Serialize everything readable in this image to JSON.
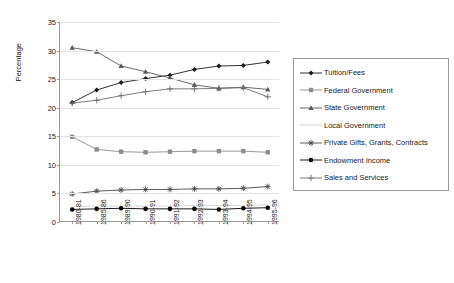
{
  "chart_data": {
    "type": "line",
    "title": "",
    "xlabel": "",
    "ylabel": "Percentage",
    "ylim": [
      0,
      35
    ],
    "yticks": [
      0,
      5,
      10,
      15,
      20,
      25,
      30,
      35
    ],
    "grid": true,
    "legend_position": "right",
    "categories": [
      "1980-81",
      "1985-86",
      "1989-90",
      "1990-91",
      "1991-92",
      "1992-93",
      "1993-94",
      "1994-95",
      "1995-96"
    ],
    "series": [
      {
        "name": "Tuition/Fees",
        "marker": "diamond",
        "color": "#1a1a1a",
        "values": [
          20.9,
          23.1,
          24.4,
          25.1,
          25.7,
          26.7,
          27.3,
          27.4,
          28.0
        ]
      },
      {
        "name": "Federal Government",
        "marker": "square",
        "color": "#8c8c8c",
        "values": [
          14.9,
          12.7,
          12.3,
          12.2,
          12.3,
          12.4,
          12.4,
          12.4,
          12.2
        ]
      },
      {
        "name": "State Government",
        "marker": "triangle",
        "color": "#5a5a5a",
        "values": [
          30.5,
          29.8,
          27.3,
          26.3,
          25.2,
          24.0,
          23.4,
          23.6,
          23.2
        ]
      },
      {
        "name": "Local Government",
        "marker": "none",
        "color": "#d4d4d4",
        "values": [
          2.7,
          2.8,
          2.8,
          2.8,
          2.8,
          2.9,
          2.9,
          2.9,
          3.0
        ]
      },
      {
        "name": "Private Gifts, Grants, Contracts",
        "marker": "asterisk",
        "color": "#4a4a4a",
        "values": [
          4.9,
          5.4,
          5.6,
          5.7,
          5.7,
          5.8,
          5.8,
          5.9,
          6.2
        ]
      },
      {
        "name": "Endowment Income",
        "marker": "circle",
        "color": "#000000",
        "values": [
          2.2,
          2.3,
          2.4,
          2.3,
          2.3,
          2.3,
          2.2,
          2.4,
          2.5
        ]
      },
      {
        "name": "Sales and Services",
        "marker": "plus",
        "color": "#6e6e6e",
        "values": [
          20.8,
          21.3,
          22.1,
          22.8,
          23.3,
          23.3,
          23.4,
          23.5,
          21.9
        ]
      }
    ]
  }
}
